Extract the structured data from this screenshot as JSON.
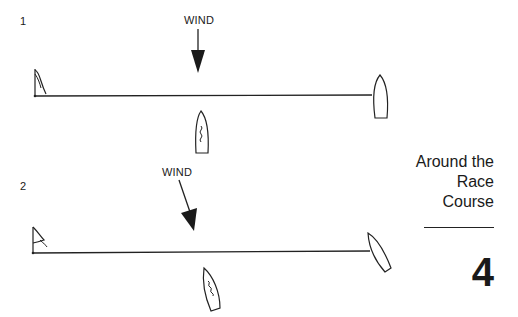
{
  "diagrams": [
    {
      "number": "1",
      "wind_label": "WIND",
      "wind_direction": "straight-down"
    },
    {
      "number": "2",
      "wind_label": "WIND",
      "wind_direction": "diagonal"
    }
  ],
  "sidebar": {
    "title_lines": [
      "Around the",
      "Race",
      "Course"
    ],
    "chapter_number": "4"
  },
  "colors": {
    "ink": "#1a1a1a",
    "background": "#ffffff"
  }
}
